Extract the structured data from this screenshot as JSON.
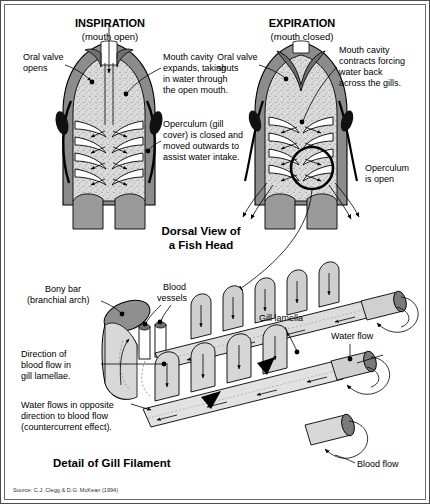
{
  "figure": {
    "source_note": "Source: C.J. Clegg & D.G. McKean (1994)",
    "caption_top": "Dorsal View of",
    "caption_top2": "a Fish Head",
    "caption_bottom": "Detail of Gill Filament"
  },
  "colors": {
    "body_dark": "#8c8c8c",
    "cavity": "#d9d9d9",
    "gill_body": "#9a9a9a",
    "outline": "#000000",
    "lamella": "#d2d2d2",
    "filament_tip": "#7a7a7a",
    "bony_bar": "#8f8f8f",
    "border": "#4a4a4a"
  },
  "inspiration": {
    "title": "INSPIRATION",
    "subtitle": "(mouth open)",
    "labels": [
      {
        "id": "oral-valve-opens",
        "line1": "Oral valve",
        "line2": "opens"
      },
      {
        "id": "mouth-cavity-expands",
        "line1": "Mouth cavity",
        "line2": "expands, taking",
        "line3": "in water through",
        "line4": "the open mouth."
      },
      {
        "id": "operculum-closed",
        "line1": "Operculum (gill",
        "line2": "cover) is closed and",
        "line3": "moved outwards to",
        "line4": "assist water intake."
      }
    ]
  },
  "expiration": {
    "title": "EXPIRATION",
    "subtitle": "(mouth closed)",
    "labels": [
      {
        "id": "oral-valve-shuts",
        "line1": "Oral valve",
        "line2": "shuts"
      },
      {
        "id": "mouth-cavity-contracts",
        "line1": "Mouth cavity",
        "line2": "contracts forcing",
        "line3": "water back",
        "line4": "across the gills."
      },
      {
        "id": "operculum-open",
        "line1": "Operculum",
        "line2": "is open"
      }
    ]
  },
  "filament": {
    "labels": [
      {
        "id": "bony-bar",
        "line1": "Bony bar",
        "line2": "(branchial arch)"
      },
      {
        "id": "blood-vessels",
        "line1": "Blood",
        "line2": "vessels"
      },
      {
        "id": "gill-lamella",
        "line1": "Gill lamella"
      },
      {
        "id": "water-flow",
        "line1": "Water flow"
      },
      {
        "id": "blood-flow-direction",
        "line1": "Direction of",
        "line2": "blood flow in",
        "line3": "gill lamellae."
      },
      {
        "id": "countercurrent",
        "line1": "Water flows in opposite",
        "line2": "direction to blood flow",
        "line3": "(countercurrent effect)."
      },
      {
        "id": "blood-flow",
        "line1": "Blood flow"
      }
    ]
  }
}
